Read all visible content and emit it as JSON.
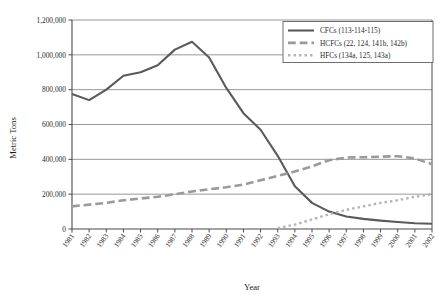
{
  "chart_data": {
    "type": "line",
    "title": "",
    "xlabel": "Year",
    "ylabel": "Metric Tons",
    "xlim": [
      1981,
      2002
    ],
    "ylim": [
      0,
      1200000
    ],
    "ytick_step": 200000,
    "grid": true,
    "grid_axis": "y",
    "legend_position": "top-right",
    "ytick_labels": [
      "0",
      "200,000",
      "400,000",
      "600,000",
      "800,000",
      "1,000,000",
      "1,200,000"
    ],
    "ytick_values": [
      0,
      200000,
      400000,
      600000,
      800000,
      1000000,
      1200000
    ],
    "categories": [
      "1981",
      "1982",
      "1983",
      "1984",
      "1985",
      "1986",
      "1987",
      "1988",
      "1989",
      "1990",
      "1991",
      "1992",
      "1993",
      "1994",
      "1995",
      "1996",
      "1997",
      "1998",
      "1999",
      "2000",
      "2001",
      "2002"
    ],
    "x": [
      1981,
      1982,
      1983,
      1984,
      1985,
      1986,
      1987,
      1988,
      1989,
      1990,
      1991,
      1992,
      1993,
      1994,
      1995,
      1996,
      1997,
      1998,
      1999,
      2000,
      2001,
      2002
    ],
    "series": [
      {
        "name": "CFCs (113-114-115)",
        "style": "solid",
        "color": "#5a5a5a",
        "width": 2.1,
        "values": [
          775000,
          740000,
          800000,
          880000,
          900000,
          940000,
          1030000,
          1075000,
          985000,
          810000,
          665000,
          570000,
          420000,
          245000,
          150000,
          100000,
          72000,
          58000,
          48000,
          40000,
          33000,
          30000
        ]
      },
      {
        "name": "HCFCs (22, 124, 141b, 142b)",
        "style": "dashed",
        "color": "#9a9a9a",
        "width": 2.6,
        "values": [
          130000,
          140000,
          150000,
          165000,
          175000,
          185000,
          200000,
          215000,
          228000,
          240000,
          255000,
          280000,
          305000,
          330000,
          360000,
          395000,
          410000,
          412000,
          415000,
          418000,
          405000,
          372000
        ]
      },
      {
        "name": "HFCs (134a, 125, 143a)",
        "style": "dotted",
        "color": "#b5b5b5",
        "width": 2.4,
        "values": [
          null,
          null,
          null,
          null,
          null,
          null,
          null,
          null,
          null,
          null,
          null,
          null,
          5000,
          25000,
          55000,
          85000,
          110000,
          130000,
          150000,
          165000,
          185000,
          200000
        ]
      }
    ]
  },
  "legend": {
    "items": [
      {
        "label": "CFCs (113-114-115)",
        "style": "solid",
        "color": "#5a5a5a"
      },
      {
        "label": "HCFCs (22, 124, 141b, 142b)",
        "style": "dashed",
        "color": "#9a9a9a"
      },
      {
        "label": "HFCs (134a, 125, 143a)",
        "style": "dotted",
        "color": "#b5b5b5"
      }
    ]
  },
  "axes": {
    "y_title": "Metric Tons",
    "x_title": "Year"
  },
  "colors": {
    "axis": "#4a4a4a",
    "grid": "#8c8c8c",
    "text": "#2b2b2b",
    "background": "#ffffff"
  }
}
